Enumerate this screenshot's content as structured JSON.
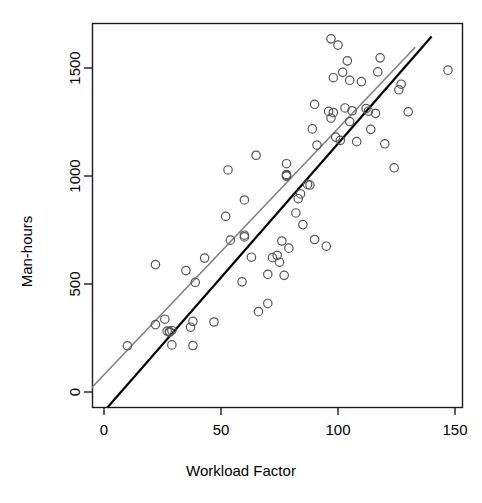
{
  "chart_data": {
    "type": "scatter",
    "title": "",
    "xlabel": "Workload Factor",
    "ylabel": "Man-hours",
    "xlim": [
      -8,
      155
    ],
    "ylim": [
      -40,
      1690
    ],
    "xticks": [
      0,
      50,
      100,
      150
    ],
    "xtick_labels": [
      "0",
      "50",
      "100",
      "150"
    ],
    "yticks": [
      0,
      500,
      1000,
      1500
    ],
    "ytick_labels": [
      "0",
      "500",
      "1000",
      "1500"
    ],
    "grid": false,
    "legend": "none",
    "point_marker": "open-circle",
    "point_color": "#555555",
    "points": [
      [
        10,
        214
      ],
      [
        22,
        590
      ],
      [
        22,
        312
      ],
      [
        26,
        337
      ],
      [
        27,
        282
      ],
      [
        28,
        276
      ],
      [
        28,
        281
      ],
      [
        29,
        285
      ],
      [
        29,
        218
      ],
      [
        35,
        562
      ],
      [
        37,
        300
      ],
      [
        38,
        327
      ],
      [
        38,
        215
      ],
      [
        39,
        508
      ],
      [
        43,
        620
      ],
      [
        47,
        324
      ],
      [
        52,
        813
      ],
      [
        53,
        1028
      ],
      [
        54,
        703
      ],
      [
        59,
        510
      ],
      [
        60,
        889
      ],
      [
        60,
        718
      ],
      [
        60,
        726
      ],
      [
        63,
        624
      ],
      [
        65,
        1096
      ],
      [
        66,
        372
      ],
      [
        70,
        545
      ],
      [
        70,
        410
      ],
      [
        72,
        622
      ],
      [
        74,
        633
      ],
      [
        75,
        601
      ],
      [
        76,
        699
      ],
      [
        77,
        540
      ],
      [
        78,
        1057
      ],
      [
        78,
        1007
      ],
      [
        78,
        999
      ],
      [
        78,
        1002
      ],
      [
        79,
        666
      ],
      [
        82,
        829
      ],
      [
        83,
        895
      ],
      [
        84,
        917
      ],
      [
        85,
        775
      ],
      [
        87,
        961
      ],
      [
        88,
        958
      ],
      [
        89,
        1218
      ],
      [
        90,
        1332
      ],
      [
        90,
        706
      ],
      [
        91,
        1143
      ],
      [
        95,
        675
      ],
      [
        96,
        1299
      ],
      [
        97,
        1268
      ],
      [
        97,
        1635
      ],
      [
        98,
        1294
      ],
      [
        98,
        1455
      ],
      [
        99,
        1180
      ],
      [
        100,
        1606
      ],
      [
        101,
        1165
      ],
      [
        102,
        1480
      ],
      [
        103,
        1315
      ],
      [
        104,
        1533
      ],
      [
        105,
        1443
      ],
      [
        105,
        1252
      ],
      [
        106,
        1302
      ],
      [
        108,
        1159
      ],
      [
        110,
        1437
      ],
      [
        112,
        1312
      ],
      [
        113,
        1300
      ],
      [
        114,
        1216
      ],
      [
        116,
        1290
      ],
      [
        117,
        1482
      ],
      [
        118,
        1547
      ],
      [
        120,
        1149
      ],
      [
        124,
        1038
      ],
      [
        126,
        1399
      ],
      [
        127,
        1425
      ],
      [
        130,
        1297
      ],
      [
        147,
        1490
      ]
    ],
    "lines": [
      {
        "name": "fitted-line-gray",
        "color": "#808080",
        "width": 1.6,
        "intercept": 80,
        "slope": 11.4,
        "x_start": -8,
        "x_end": 133
      },
      {
        "name": "fitted-line-black",
        "color": "#000000",
        "width": 2.2,
        "intercept": -90,
        "slope": 12.4,
        "x_start": -7,
        "x_end": 140
      }
    ]
  },
  "axes": {
    "x_title": "Workload Factor",
    "y_title": "Man-hours"
  },
  "style": {
    "frame_color": "#1a1a1a",
    "tick_color": "#1a1a1a",
    "background": "#ffffff",
    "marker_stroke": "#555555"
  }
}
